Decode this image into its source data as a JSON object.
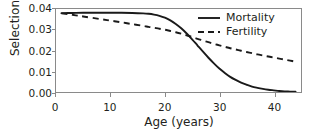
{
  "chart_data": {
    "type": "line",
    "title": "",
    "xlabel": "Age (years)",
    "ylabel": "Selection",
    "xlim": [
      0,
      45
    ],
    "ylim": [
      0.0,
      0.04
    ],
    "xticks": [
      "0",
      "10",
      "20",
      "30",
      "40"
    ],
    "xtick_values": [
      0,
      10,
      20,
      30,
      40
    ],
    "yticks": [
      "0.00",
      "0.01",
      "0.02",
      "0.03",
      "0.04"
    ],
    "ytick_values": [
      0.0,
      0.01,
      0.02,
      0.03,
      0.04
    ],
    "grid": false,
    "legend_position": "top-right",
    "x": [
      1,
      3,
      5,
      8,
      10,
      12,
      14,
      16,
      17,
      18,
      19,
      20,
      21,
      22,
      23,
      24,
      25,
      26,
      27,
      28,
      29,
      30,
      31,
      32,
      33,
      34,
      35,
      36,
      37,
      38,
      39,
      40,
      41,
      42,
      43,
      44
    ],
    "series": [
      {
        "name": "Mortality",
        "style": "solid",
        "color": "#1a1a1a",
        "values": [
          0.038,
          0.0381,
          0.0382,
          0.0382,
          0.0382,
          0.0382,
          0.0381,
          0.0379,
          0.0377,
          0.0373,
          0.0367,
          0.0358,
          0.0345,
          0.0328,
          0.0307,
          0.0282,
          0.0254,
          0.0224,
          0.0194,
          0.0165,
          0.0138,
          0.0113,
          0.0092,
          0.0073,
          0.0058,
          0.0045,
          0.0035,
          0.0026,
          0.002,
          0.0015,
          0.0011,
          0.0008,
          0.0005,
          0.0003,
          0.0002,
          0.0001
        ]
      },
      {
        "name": "Fertility",
        "style": "dashed",
        "color": "#1a1a1a",
        "values": [
          0.0379,
          0.0372,
          0.0364,
          0.0352,
          0.0344,
          0.0336,
          0.0327,
          0.0319,
          0.0314,
          0.031,
          0.0305,
          0.03,
          0.0294,
          0.0288,
          0.0281,
          0.0273,
          0.0265,
          0.0256,
          0.0248,
          0.024,
          0.0232,
          0.0225,
          0.0218,
          0.0211,
          0.0205,
          0.0199,
          0.0193,
          0.0187,
          0.0181,
          0.0176,
          0.0171,
          0.0166,
          0.0161,
          0.0156,
          0.0151,
          0.0146
        ]
      }
    ],
    "annotations": {
      "crossover_age": 23,
      "crossover_value": 0.0225
    }
  },
  "legend": {
    "items": [
      {
        "label": "Mortality",
        "style": "solid"
      },
      {
        "label": "Fertility",
        "style": "dashed"
      }
    ]
  },
  "axes": {
    "x_title": "Age (years)",
    "y_title": "Selection"
  },
  "colors": {
    "line": "#1a1a1a",
    "frame": "#8a8a8a",
    "text": "#231f20",
    "background": "#ffffff"
  }
}
